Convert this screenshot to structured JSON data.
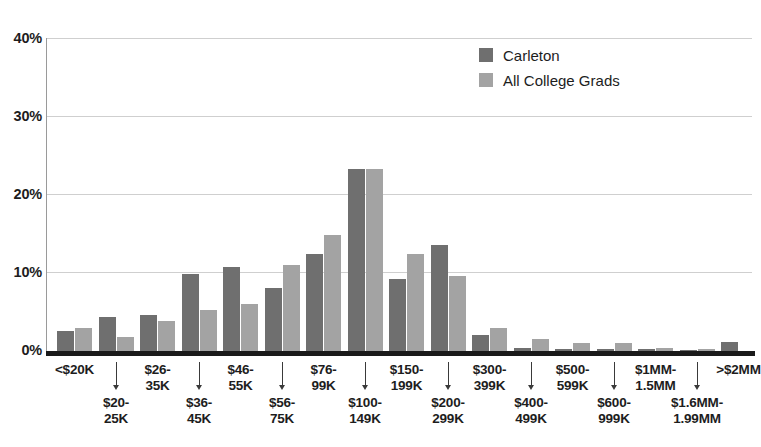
{
  "chart_data": {
    "type": "bar",
    "title": "",
    "subtitle": "",
    "xlabel": "",
    "ylabel": "",
    "ylim": [
      0,
      40
    ],
    "yticks": [
      0,
      10,
      20,
      30,
      40
    ],
    "ytick_labels": [
      "0%",
      "10%",
      "20%",
      "30%",
      "40%"
    ],
    "grid": true,
    "legend_position": "top-right",
    "categories": [
      "<$20K",
      "$20-\n25K",
      "$26-\n35K",
      "$36-\n45K",
      "$46-\n55K",
      "$56-\n75K",
      "$76-\n99K",
      "$100-\n149K",
      "$150-\n199K",
      "$200-\n299K",
      "$300-\n399K",
      "$400-\n499K",
      "$500-\n599K",
      "$600-\n999K",
      "$1MM-\n1.5MM",
      "$1.6MM-\n1.99MM",
      ">$2MM"
    ],
    "series": [
      {
        "name": "Carleton",
        "color": "#6f6f6f",
        "values": [
          2.5,
          4.4,
          4.6,
          9.8,
          10.8,
          8.1,
          12.4,
          23.2,
          9.2,
          13.5,
          2.1,
          0.35,
          0.3,
          0.2,
          0.3,
          0.1,
          1.1
        ]
      },
      {
        "name": "All College Grads",
        "color": "#a3a3a3",
        "values": [
          2.9,
          1.8,
          3.8,
          5.2,
          6.0,
          11.0,
          14.8,
          23.2,
          12.4,
          9.6,
          3.0,
          1.5,
          1.0,
          1.0,
          0.4,
          0.2,
          0.0
        ]
      }
    ]
  },
  "legend": {
    "items": [
      {
        "label": "Carleton",
        "color": "#6f6f6f"
      },
      {
        "label": "All College Grads",
        "color": "#a3a3a3"
      }
    ]
  },
  "axis": {
    "y_tick_labels": [
      "40%",
      "30%",
      "20%",
      "10%",
      "0%"
    ]
  },
  "x_axis": {
    "labels": [
      {
        "text": "<$20K",
        "pos": "top",
        "arrow": false
      },
      {
        "text": "$20-\n25K",
        "pos": "bot",
        "arrow": true
      },
      {
        "text": "$26-\n35K",
        "pos": "top",
        "arrow": false
      },
      {
        "text": "$36-\n45K",
        "pos": "bot",
        "arrow": true
      },
      {
        "text": "$46-\n55K",
        "pos": "top",
        "arrow": false
      },
      {
        "text": "$56-\n75K",
        "pos": "bot",
        "arrow": true
      },
      {
        "text": "$76-\n99K",
        "pos": "top",
        "arrow": false
      },
      {
        "text": "$100-\n149K",
        "pos": "bot",
        "arrow": true
      },
      {
        "text": "$150-\n199K",
        "pos": "top",
        "arrow": false
      },
      {
        "text": "$200-\n299K",
        "pos": "bot",
        "arrow": true
      },
      {
        "text": "$300-\n399K",
        "pos": "top",
        "arrow": false
      },
      {
        "text": "$400-\n499K",
        "pos": "bot",
        "arrow": true
      },
      {
        "text": "$500-\n599K",
        "pos": "top",
        "arrow": false
      },
      {
        "text": "$600-\n999K",
        "pos": "bot",
        "arrow": true
      },
      {
        "text": "$1MM-\n1.5MM",
        "pos": "top",
        "arrow": false
      },
      {
        "text": "$1.6MM-\n1.99MM",
        "pos": "bot",
        "arrow": true
      },
      {
        "text": ">$2MM",
        "pos": "top",
        "arrow": false
      }
    ]
  }
}
